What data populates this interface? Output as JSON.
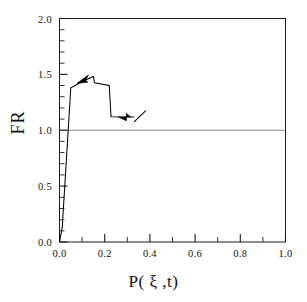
{
  "chart_data": {
    "type": "line",
    "title": "",
    "xlabel": "P( ξ ,t)",
    "ylabel": "FR",
    "xlim": [
      0.0,
      1.0
    ],
    "ylim": [
      0.0,
      2.0
    ],
    "grid": false,
    "legend": null,
    "x_major_ticks": [
      0.0,
      0.2,
      0.4,
      0.6,
      0.8,
      1.0
    ],
    "x_major_tick_labels": [
      "0.0",
      "0.2",
      "0.4",
      "0.6",
      "0.8",
      "1.0"
    ],
    "x_minor_ticks": [
      0.1,
      0.3,
      0.5,
      0.7,
      0.9
    ],
    "y_major_ticks": [
      0.0,
      0.5,
      1.0,
      1.5,
      2.0
    ],
    "y_major_tick_labels": [
      "0.0",
      "0.5",
      "1.0",
      "1.5",
      "2.0"
    ],
    "y_minor_ticks": [
      0.1,
      0.2,
      0.3,
      0.4,
      0.6,
      0.7,
      0.8,
      0.9,
      1.1,
      1.2,
      1.3,
      1.4,
      1.6,
      1.7,
      1.8,
      1.9
    ],
    "series": [
      {
        "name": "FR curve",
        "color": "#000000",
        "points": [
          [
            0.0,
            0.0
          ],
          [
            0.012,
            0.13
          ],
          [
            0.05,
            1.38
          ],
          [
            0.095,
            1.43
          ],
          [
            0.15,
            1.48
          ],
          [
            0.155,
            1.425
          ],
          [
            0.22,
            1.4
          ],
          [
            0.228,
            1.12
          ],
          [
            0.33,
            1.118
          ]
        ]
      },
      {
        "name": "trailing segment",
        "color": "#000000",
        "points": [
          [
            0.33,
            1.075
          ],
          [
            0.382,
            1.175
          ]
        ]
      }
    ],
    "reference_lines": [
      {
        "name": "unity-reference-line",
        "orientation": "horizontal",
        "value": 1.0,
        "color": "#8a8a8a"
      }
    ],
    "annotations": [
      {
        "name": "arrow-on-rise",
        "type": "arrowhead",
        "x": 0.105,
        "y": 1.438,
        "direction": "right-up"
      },
      {
        "name": "arrow-on-drop",
        "type": "arrowhead",
        "x": 0.288,
        "y": 1.118,
        "direction": "right"
      }
    ]
  },
  "axes": {
    "frame_color": "#1a1a1a",
    "curve_color": "#000000",
    "reference_color": "#8a8a8a"
  }
}
